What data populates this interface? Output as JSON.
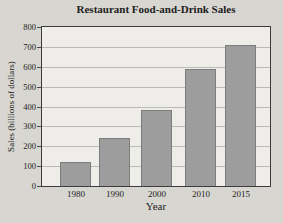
{
  "chart_data": {
    "type": "bar",
    "title": "Restaurant Food-and-Drink Sales",
    "xlabel": "Year",
    "ylabel": "Sales (billions of dollars)",
    "categories": [
      "1980",
      "1990",
      "2000",
      "2010",
      "2015"
    ],
    "values": [
      120,
      240,
      380,
      590,
      710
    ],
    "ylim": [
      0,
      800
    ],
    "yticks": [
      0,
      100,
      200,
      300,
      400,
      500,
      600,
      700,
      800
    ],
    "grid": true,
    "legend": "none",
    "colors": {
      "bar_fill": "#9d9d9d",
      "bar_border": "#7d7d7d",
      "plot_background": "#eeede9",
      "page_background": "#d8d6d0",
      "gridline": "#bcbab4",
      "axis_border": "#3c3c3c",
      "text": "#1c1c1c"
    }
  }
}
